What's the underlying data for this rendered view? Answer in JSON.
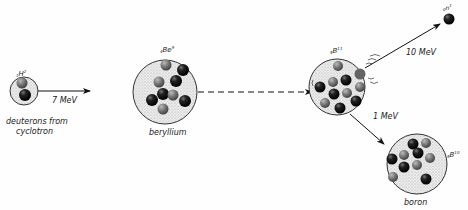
{
  "nuclei": {
    "deuteron": {
      "symbol": "H",
      "sub": "1",
      "sup": "2",
      "caption_line1": "deuterons from",
      "caption_line2": "cyclotron"
    },
    "beryllium": {
      "symbol": "Be",
      "sub": "4",
      "sup": "9",
      "caption": "beryllium"
    },
    "compound": {
      "symbol": "B",
      "sub": "5",
      "sup": "11"
    },
    "neutron": {
      "symbol": "n",
      "sub": "0",
      "sup": "1"
    },
    "boron": {
      "symbol": "B",
      "sub": "5",
      "sup": "10",
      "caption": "boron"
    }
  },
  "arrows": {
    "deuteron_energy": "7 MeV",
    "neutron_energy": "10 MeV",
    "boron_energy": "1 MeV"
  },
  "colors": {
    "proton": "#7a7a7a",
    "neutron": "#111111",
    "nucleus_fill": "#e4e4e4"
  }
}
